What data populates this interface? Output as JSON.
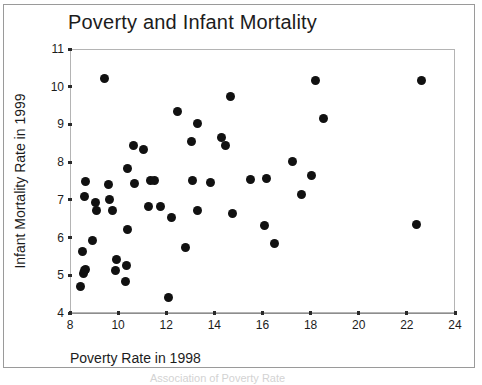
{
  "figure": {
    "title": "Poverty and Infant Mortality",
    "bottom_ghost_text": "Association of Poverty Rate"
  },
  "chart_data": {
    "type": "scatter",
    "title": "Poverty and Infant Mortality",
    "xlabel": "Poverty Rate in 1998",
    "ylabel": "Infant Mortality Rate in 1999",
    "xlim": [
      8,
      24
    ],
    "ylim": [
      4,
      11
    ],
    "xticks": [
      8,
      10,
      12,
      14,
      16,
      18,
      20,
      22,
      24
    ],
    "yticks": [
      4,
      5,
      6,
      7,
      8,
      9,
      10,
      11
    ],
    "grid": false,
    "legend": false,
    "marker": "filled-circle",
    "marker_color": "#111111",
    "points": [
      {
        "x": 8.45,
        "y": 4.7
      },
      {
        "x": 8.55,
        "y": 5.05
      },
      {
        "x": 8.6,
        "y": 5.12
      },
      {
        "x": 8.65,
        "y": 5.15
      },
      {
        "x": 8.5,
        "y": 5.62
      },
      {
        "x": 8.95,
        "y": 5.93
      },
      {
        "x": 8.6,
        "y": 7.1
      },
      {
        "x": 8.65,
        "y": 7.5
      },
      {
        "x": 9.05,
        "y": 6.93
      },
      {
        "x": 9.1,
        "y": 6.72
      },
      {
        "x": 9.45,
        "y": 10.22
      },
      {
        "x": 9.6,
        "y": 7.42
      },
      {
        "x": 9.65,
        "y": 7.02
      },
      {
        "x": 9.75,
        "y": 6.72
      },
      {
        "x": 9.9,
        "y": 5.14
      },
      {
        "x": 9.95,
        "y": 5.42
      },
      {
        "x": 10.3,
        "y": 4.83
      },
      {
        "x": 10.35,
        "y": 5.25
      },
      {
        "x": 10.4,
        "y": 6.22
      },
      {
        "x": 10.4,
        "y": 7.83
      },
      {
        "x": 10.65,
        "y": 8.43
      },
      {
        "x": 10.7,
        "y": 7.43
      },
      {
        "x": 11.05,
        "y": 8.33
      },
      {
        "x": 11.25,
        "y": 6.83
      },
      {
        "x": 11.35,
        "y": 7.52
      },
      {
        "x": 11.5,
        "y": 7.52
      },
      {
        "x": 11.75,
        "y": 6.82
      },
      {
        "x": 12.1,
        "y": 4.42
      },
      {
        "x": 12.2,
        "y": 6.53
      },
      {
        "x": 12.45,
        "y": 9.33
      },
      {
        "x": 12.8,
        "y": 5.73
      },
      {
        "x": 13.05,
        "y": 8.55
      },
      {
        "x": 13.1,
        "y": 7.52
      },
      {
        "x": 13.3,
        "y": 9.03
      },
      {
        "x": 13.3,
        "y": 6.73
      },
      {
        "x": 13.85,
        "y": 7.45
      },
      {
        "x": 14.3,
        "y": 8.65
      },
      {
        "x": 14.45,
        "y": 8.45
      },
      {
        "x": 14.65,
        "y": 9.73
      },
      {
        "x": 14.75,
        "y": 6.63
      },
      {
        "x": 15.5,
        "y": 7.55
      },
      {
        "x": 16.1,
        "y": 6.33
      },
      {
        "x": 16.15,
        "y": 7.57
      },
      {
        "x": 16.5,
        "y": 5.85
      },
      {
        "x": 17.25,
        "y": 8.03
      },
      {
        "x": 17.6,
        "y": 7.13
      },
      {
        "x": 18.05,
        "y": 7.65
      },
      {
        "x": 18.2,
        "y": 10.16
      },
      {
        "x": 18.55,
        "y": 9.15
      },
      {
        "x": 22.4,
        "y": 6.35
      },
      {
        "x": 22.6,
        "y": 10.17
      }
    ]
  }
}
